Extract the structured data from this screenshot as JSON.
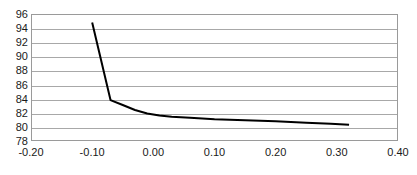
{
  "chart_data": {
    "type": "line",
    "title": "",
    "subtitle": "",
    "xlabel": "",
    "ylabel": "",
    "xlim": [
      -0.2,
      0.4
    ],
    "ylim": [
      78,
      96
    ],
    "xticks": [
      -0.2,
      -0.1,
      0.0,
      0.1,
      0.2,
      0.3,
      0.4
    ],
    "xtick_labels": [
      "-0.20",
      "-0.10",
      "0.00",
      "0.10",
      "0.20",
      "0.30",
      "0.40"
    ],
    "yticks": [
      78,
      80,
      82,
      84,
      86,
      88,
      90,
      92,
      94,
      96
    ],
    "ytick_labels": [
      "78",
      "80",
      "82",
      "84",
      "86",
      "88",
      "90",
      "92",
      "94",
      "96"
    ],
    "grid": {
      "horizontal": true,
      "vertical": false,
      "color": "#a8a8a8"
    },
    "legend": {
      "visible": false,
      "position": "none",
      "entries": []
    },
    "annotations": [],
    "plot_border_color": "#9a9a9a",
    "background_color": "#ffffff",
    "series": [
      {
        "name": "series-1",
        "color": "#000000",
        "line_width": 2,
        "markers": false,
        "x": [
          -0.1,
          -0.07,
          -0.05,
          -0.03,
          -0.01,
          0.01,
          0.03,
          0.06,
          0.1,
          0.15,
          0.2,
          0.25,
          0.29,
          0.32
        ],
        "y": [
          94.8,
          83.8,
          83.1,
          82.4,
          81.9,
          81.6,
          81.45,
          81.3,
          81.1,
          80.95,
          80.8,
          80.6,
          80.45,
          80.3
        ]
      }
    ]
  }
}
